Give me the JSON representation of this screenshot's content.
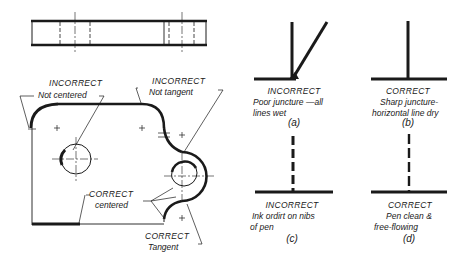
{
  "left_figure": {
    "labels": {
      "incorrect_not_centered": {
        "title": "INCORRECT",
        "subtitle": "Not centered"
      },
      "incorrect_not_tangent": {
        "title": "INCORRECT",
        "subtitle": "Not tangent"
      },
      "correct_centered": {
        "title": "CORRECT",
        "subtitle": "centered"
      },
      "correct_tangent": {
        "title": "CORRECT",
        "subtitle": "Tangent"
      }
    }
  },
  "right_figure": {
    "panels": [
      {
        "id": "a",
        "status": "INCORRECT",
        "line1": "Poor juncture —all",
        "line2": "lines wet",
        "caption": "(a)"
      },
      {
        "id": "b",
        "status": "CORRECT",
        "line1": "Sharp juncture-",
        "line2": "horizontal line dry",
        "caption": "(b)"
      },
      {
        "id": "c",
        "status": "INCORRECT",
        "line1": "Ink ordirt on nibs",
        "line2": "of pen",
        "caption": "(c)"
      },
      {
        "id": "d",
        "status": "CORRECT",
        "line1": "Pen clean &",
        "line2": "free-flowing",
        "caption": "(d)"
      }
    ]
  },
  "colors": {
    "ink": "#1a1a1a",
    "background": "#ffffff"
  }
}
